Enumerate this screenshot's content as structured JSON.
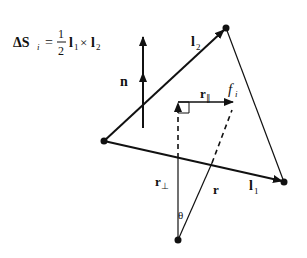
{
  "formula": {
    "lhs": "ΔS",
    "lhs_sub": "i",
    "equals": "=",
    "frac_num": "1",
    "frac_den": "2",
    "term1": "l",
    "term1_sub": "1",
    "times": "×",
    "term2": "l",
    "term2_sub": "2"
  },
  "labels": {
    "normal": "n",
    "edge2": "l",
    "edge2_sub": "2",
    "edge1": "l",
    "edge1_sub": "1",
    "face": "f",
    "face_sub": "i",
    "r_parallel": "r",
    "r_parallel_sub": "∥",
    "r_perp": "r",
    "r_perp_sub": "⊥",
    "r": "r",
    "angle": "θ"
  },
  "colors": {
    "stroke": "#111111",
    "background": "#ffffff"
  }
}
